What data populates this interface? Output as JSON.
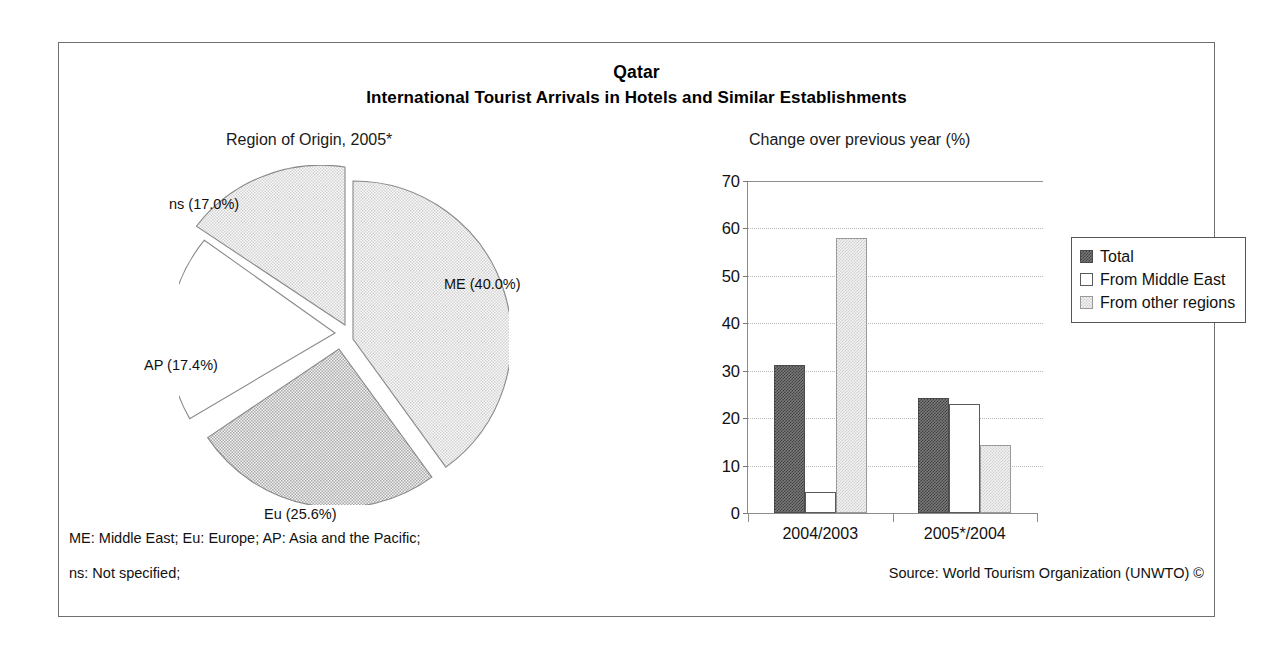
{
  "titles": {
    "country": "Qatar",
    "main": "International Tourist Arrivals in Hotels and Similar Establishments",
    "pie_panel": "Region of Origin, 2005*",
    "bar_panel": "Change over previous year (%)"
  },
  "footer": {
    "note1": "ME: Middle East; Eu: Europe; AP: Asia and the Pacific;",
    "note2": "ns: Not specified;",
    "source": "Source: World Tourism Organization (UNWTO) ©"
  },
  "pie_labels": {
    "me": "ME (40.0%)",
    "eu": "Eu (25.6%)",
    "ap": "AP (17.4%)",
    "ns": "ns (17.0%)"
  },
  "bar_ticks": [
    "70",
    "60",
    "50",
    "40",
    "30",
    "20",
    "10",
    "0"
  ],
  "bar_categories": [
    "2004/2003",
    "2005*/2004"
  ],
  "legend": [
    {
      "label": "Total",
      "swatch": "dark"
    },
    {
      "label": "From Middle East",
      "swatch": "white"
    },
    {
      "label": "From other regions",
      "swatch": "light"
    }
  ],
  "colors": {
    "dark_fill": "#7a7a7a",
    "light_fill": "#e8e8e8",
    "white_fill": "#ffffff",
    "border": "#6f6f6f",
    "gridline": "#b9b9b9",
    "text": "#111111"
  },
  "chart_data": [
    {
      "type": "pie",
      "title": "Region of Origin, 2005*",
      "labels": [
        "ME",
        "Eu",
        "AP",
        "ns"
      ],
      "label_text": [
        "ME (40.0%)",
        "Eu (25.6%)",
        "AP (17.4%)",
        "ns (17.0%)"
      ],
      "values": [
        40.0,
        25.6,
        17.4,
        17.0
      ],
      "unit": "percent",
      "exploded": true,
      "start_angle_deg": 0,
      "direction": "clockwise",
      "slice_fills": [
        "light-dither",
        "medium-dither",
        "white",
        "light-dither"
      ],
      "legend": "labels placed outside slices"
    },
    {
      "type": "bar",
      "title": "Change over previous year (%)",
      "xlabel": "",
      "ylabel": "",
      "categories": [
        "2004/2003",
        "2005*/2004"
      ],
      "series": [
        {
          "name": "Total",
          "values": [
            31.3,
            24.2
          ]
        },
        {
          "name": "From Middle East",
          "values": [
            4.4,
            23.0
          ]
        },
        {
          "name": "From other regions",
          "values": [
            58.0,
            14.3
          ]
        }
      ],
      "ylim": [
        0,
        70
      ],
      "ytick_step": 10,
      "yticks": [
        0,
        10,
        20,
        30,
        40,
        50,
        60,
        70
      ],
      "grid": "horizontal-dotted",
      "legend_position": "right"
    }
  ]
}
